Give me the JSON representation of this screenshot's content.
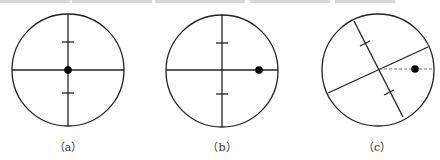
{
  "figures": [
    {
      "id": "a",
      "label": "（a）",
      "circle": {
        "cx": 68,
        "cy": 70,
        "r": 56
      },
      "crosshair_rotation_deg": 0,
      "dot": {
        "x": 68,
        "y": 70
      },
      "ticks": [
        {
          "x": 68,
          "y": 42
        },
        {
          "x": 68,
          "y": 93
        }
      ],
      "dashed_reference_line": false
    },
    {
      "id": "b",
      "label": "（b）",
      "circle": {
        "cx": 222,
        "cy": 71,
        "r": 56
      },
      "crosshair_rotation_deg": 0,
      "dot": {
        "x": 259,
        "y": 70
      },
      "ticks": [
        {
          "x": 222,
          "y": 43
        },
        {
          "x": 222,
          "y": 94
        }
      ],
      "dashed_reference_line": false
    },
    {
      "id": "c",
      "label": "（c）",
      "circle": {
        "cx": 378,
        "cy": 70,
        "r": 56
      },
      "crosshair_rotation_deg": -26,
      "dot": {
        "x": 415,
        "y": 69
      },
      "ticks": [
        {
          "x": 365,
          "y": 43
        },
        {
          "x": 389,
          "y": 92
        }
      ],
      "dashed_reference_line": true
    }
  ],
  "colors": {
    "stroke": "#222222",
    "dashed": "#777777",
    "dot": "#000000",
    "label": "#333333"
  }
}
